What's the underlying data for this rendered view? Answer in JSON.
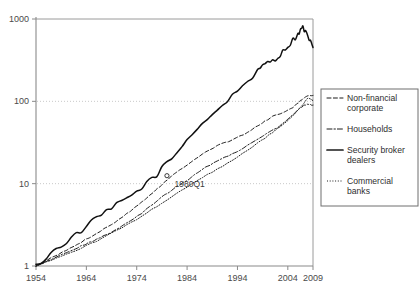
{
  "chart_data": {
    "type": "line",
    "title": "",
    "subtitle": "",
    "xlabel": "",
    "ylabel": "",
    "yscale": "log",
    "ylim": [
      1,
      1000
    ],
    "xlim": [
      1954,
      2009
    ],
    "grid": true,
    "gridlines_at": [
      10,
      100
    ],
    "legend_position": "right",
    "x_tick_labels": [
      "1954",
      "1964",
      "1974",
      "1984",
      "1994",
      "2004",
      "2009"
    ],
    "x_tick_values": [
      1954,
      1964,
      1974,
      1984,
      1994,
      2004,
      2009
    ],
    "y_tick_labels": [
      "1000",
      "100",
      "10",
      "1"
    ],
    "y_tick_values": [
      1000,
      100,
      10,
      1
    ],
    "annotations": [
      {
        "text": "1980Q1",
        "x": 1981.5,
        "y": 9.0,
        "marker": "circle",
        "marker_x": 1980.0,
        "marker_y": 12.5
      }
    ],
    "series": [
      {
        "name": "Non-financial corporate",
        "style": "dashed",
        "x": [
          1954,
          1957,
          1960,
          1963,
          1966,
          1969,
          1972,
          1975,
          1978,
          1981,
          1984,
          1987,
          1990,
          1993,
          1996,
          1999,
          2001,
          2003,
          2005,
          2006,
          2007,
          2008,
          2009
        ],
        "values": [
          1.0,
          1.25,
          1.55,
          1.95,
          2.5,
          3.2,
          4.3,
          6.0,
          8.6,
          12.5,
          17.0,
          23.0,
          29.0,
          34.0,
          42.0,
          55.0,
          66.0,
          72.0,
          84.0,
          95.0,
          108.0,
          118.0,
          118.0
        ]
      },
      {
        "name": "Households",
        "style": "dashdot",
        "x": [
          1954,
          1957,
          1960,
          1963,
          1966,
          1969,
          1972,
          1975,
          1978,
          1981,
          1984,
          1987,
          1990,
          1993,
          1996,
          1999,
          2002,
          2004,
          2006,
          2007,
          2008,
          2009
        ],
        "values": [
          1.0,
          1.2,
          1.45,
          1.75,
          2.1,
          2.6,
          3.3,
          4.4,
          6.2,
          8.4,
          11.0,
          15.0,
          19.0,
          23.0,
          29.0,
          38.0,
          48.0,
          60.0,
          78.0,
          88.0,
          92.0,
          90.0
        ]
      },
      {
        "name": "Security broker dealers",
        "style": "solid",
        "x": [
          1954,
          1958,
          1962,
          1966,
          1970,
          1974,
          1978,
          1982,
          1986,
          1990,
          1994,
          1998,
          2000,
          2002,
          2004,
          2006,
          2007,
          2008,
          2009
        ],
        "values": [
          1.0,
          1.6,
          2.4,
          3.8,
          5.5,
          8.0,
          13.0,
          24.0,
          48.0,
          78.0,
          135.0,
          230.0,
          300.0,
          340.0,
          470.0,
          650.0,
          800.0,
          600.0,
          450.0
        ]
      },
      {
        "name": "Commercial banks",
        "style": "dotted",
        "x": [
          1954,
          1958,
          1962,
          1966,
          1970,
          1974,
          1978,
          1982,
          1986,
          1990,
          1994,
          1998,
          2001,
          2004,
          2006,
          2007,
          2008,
          2009
        ],
        "values": [
          1.0,
          1.25,
          1.55,
          2.0,
          2.7,
          3.7,
          5.3,
          7.6,
          11.0,
          15.0,
          21.0,
          31.0,
          42.0,
          58.0,
          78.0,
          92.0,
          110.0,
          102.0
        ]
      }
    ]
  },
  "legend": {
    "items": [
      {
        "label": "Non-financial corporate",
        "style": "dashed"
      },
      {
        "label": "Households",
        "style": "dashdot"
      },
      {
        "label": "Security broker dealers",
        "style": "solid"
      },
      {
        "label": "Commercial banks",
        "style": "dotted"
      }
    ]
  }
}
